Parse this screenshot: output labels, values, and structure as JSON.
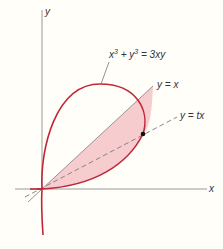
{
  "figure": {
    "axis_x_label": "x",
    "axis_y_label": "y",
    "curve_equation": {
      "base1": "x",
      "exp1": "3",
      "plus": " + ",
      "base2": "y",
      "exp2": "3",
      "rhs": " = 3xy"
    },
    "line1_label": "y = x",
    "line2_label": "y = tx",
    "colors": {
      "curve": "#c0283a",
      "fill": "#f6c3c8",
      "axis": "#9a9a9a",
      "line": "#8a8a8a",
      "background": "#fffef9"
    }
  }
}
